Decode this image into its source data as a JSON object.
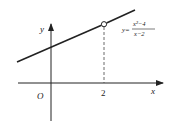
{
  "diagram": {
    "axes": {
      "x_label": "x",
      "y_label": "y",
      "origin_label": "O",
      "tick_label_x": "2"
    },
    "function": {
      "prefix": "y=",
      "numerator": "x²−4",
      "denominator": "x−2"
    },
    "features": {
      "hole_at_x": "2",
      "dashed_guide": true
    },
    "colors": {
      "stroke": "#222222",
      "background": "#ffffff"
    }
  }
}
